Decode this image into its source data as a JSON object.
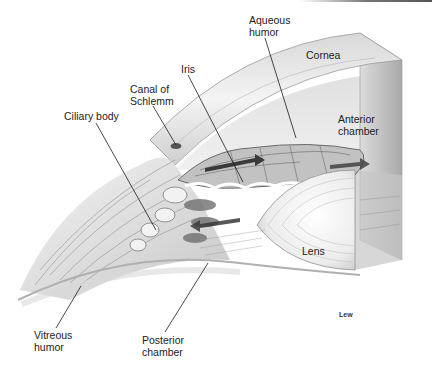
{
  "figure": {
    "artist_signature": "Lew",
    "colors": {
      "background": "#ffffff",
      "tissue_light": "#e6e6e6",
      "tissue_mid": "#b8b8b8",
      "tissue_dark": "#5a5a5a",
      "leader_line": "#1a1a1a",
      "label_text": "#222222"
    }
  },
  "labels": [
    {
      "id": "aqueous-humor",
      "text": "Aqueous\nhumor",
      "x": 249,
      "y": 14,
      "line": [
        265,
        38,
        296,
        138
      ]
    },
    {
      "id": "cornea",
      "text": "Cornea",
      "x": 306,
      "y": 49,
      "line": null
    },
    {
      "id": "iris",
      "text": "Iris",
      "x": 181,
      "y": 63,
      "line": [
        188,
        75,
        243,
        182
      ]
    },
    {
      "id": "canal-of-schlemm",
      "text": "Canal of\nSchlemm",
      "x": 130,
      "y": 83,
      "line": [
        153,
        106,
        176,
        145
      ]
    },
    {
      "id": "ciliary-body",
      "text": "Ciliary body",
      "x": 64,
      "y": 110,
      "line": [
        96,
        123,
        156,
        230
      ]
    },
    {
      "id": "anterior-chamber",
      "text": "Anterior\nchamber",
      "x": 338,
      "y": 113,
      "line": null
    },
    {
      "id": "lens",
      "text": "Lens",
      "x": 302,
      "y": 245,
      "line": null
    },
    {
      "id": "vitreous-humor",
      "text": "Vitreous\nhumor",
      "x": 34,
      "y": 329,
      "line": [
        56,
        328,
        81,
        286
      ]
    },
    {
      "id": "posterior-chamber",
      "text": "Posterior\nchamber",
      "x": 142,
      "y": 334,
      "line": [
        165,
        332,
        208,
        263
      ]
    }
  ]
}
